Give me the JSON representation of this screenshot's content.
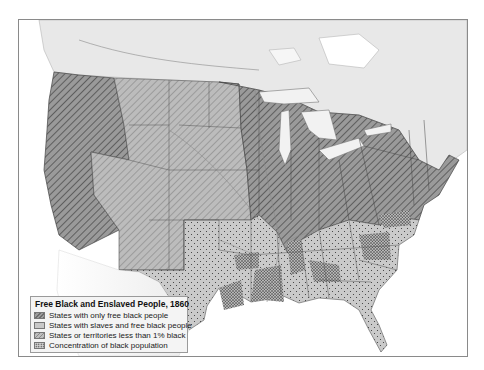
{
  "map": {
    "title": "Free Black and Enslaved People, 1860",
    "region": "United States, 1860",
    "colors": {
      "background": "#ffffff",
      "land_outside": "#e9e9e9",
      "free_states": "#8c8c8c",
      "slave_states": "#c6c6c6",
      "territories": "#b3b3b3",
      "concentration_dots": "#222222",
      "water": "#ffffff",
      "borders": "#555555"
    }
  },
  "legend": {
    "title": "Free Black and Enslaved People, 1860",
    "items": [
      {
        "key": "free",
        "label": "States with only free black people"
      },
      {
        "key": "slave",
        "label": "States with slaves and free black people"
      },
      {
        "key": "territory",
        "label": "States or territories less than 1% black"
      },
      {
        "key": "concentration",
        "label": "Concentration of black population"
      }
    ]
  }
}
